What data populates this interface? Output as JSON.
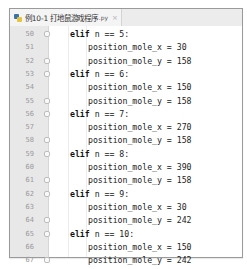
{
  "tab": {
    "icon": "python-file-icon",
    "title": "例10-1 打地鼠游戏程序",
    "ext": ".py",
    "close": "×"
  },
  "lines": [
    {
      "num": "50",
      "indent": 1,
      "kw": "elif",
      "rest": " n == 5:",
      "fold": true
    },
    {
      "num": "51",
      "indent": 2,
      "kw": "",
      "rest": "position_mole_x = 30",
      "fold": false
    },
    {
      "num": "52",
      "indent": 2,
      "kw": "",
      "rest": "position_mole_y = 158",
      "fold": true
    },
    {
      "num": "53",
      "indent": 1,
      "kw": "elif",
      "rest": " n == 6:",
      "fold": true
    },
    {
      "num": "54",
      "indent": 2,
      "kw": "",
      "rest": "position_mole_x = 150",
      "fold": false
    },
    {
      "num": "55",
      "indent": 2,
      "kw": "",
      "rest": "position_mole_y = 158",
      "fold": true
    },
    {
      "num": "56",
      "indent": 1,
      "kw": "elif",
      "rest": " n == 7:",
      "fold": true
    },
    {
      "num": "57",
      "indent": 2,
      "kw": "",
      "rest": "position_mole_x = 270",
      "fold": false
    },
    {
      "num": "58",
      "indent": 2,
      "kw": "",
      "rest": "position_mole_y = 158",
      "fold": true
    },
    {
      "num": "59",
      "indent": 1,
      "kw": "elif",
      "rest": " n == 8:",
      "fold": true
    },
    {
      "num": "60",
      "indent": 2,
      "kw": "",
      "rest": "position_mole_x = 390",
      "fold": false
    },
    {
      "num": "61",
      "indent": 2,
      "kw": "",
      "rest": "position_mole_y = 158",
      "fold": true
    },
    {
      "num": "62",
      "indent": 1,
      "kw": "elif",
      "rest": " n == 9:",
      "fold": true
    },
    {
      "num": "63",
      "indent": 2,
      "kw": "",
      "rest": "position_mole_x = 30",
      "fold": false
    },
    {
      "num": "64",
      "indent": 2,
      "kw": "",
      "rest": "position_mole_y = 242",
      "fold": true
    },
    {
      "num": "65",
      "indent": 1,
      "kw": "elif",
      "rest": " n == 10:",
      "fold": true
    },
    {
      "num": "66",
      "indent": 2,
      "kw": "",
      "rest": "position_mole_x = 150",
      "fold": false
    },
    {
      "num": "67",
      "indent": 2,
      "kw": "",
      "rest": "position_mole_y = 242",
      "fold": true
    }
  ]
}
